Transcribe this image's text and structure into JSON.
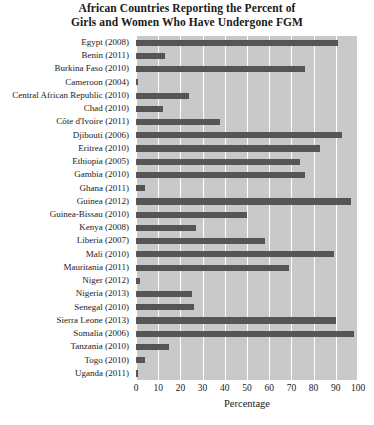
{
  "chart_data": {
    "type": "bar",
    "orientation": "horizontal",
    "title": "African Countries Reporting the Percent of Girls and Women Who Have Undergone FGM",
    "title_lines": [
      "African Countries Reporting the Percent of",
      "Girls and Women Who Have Undergone FGM"
    ],
    "xlabel": "Percentage",
    "ylabel": "",
    "xlim": [
      0,
      100
    ],
    "xticks": [
      0,
      10,
      20,
      30,
      40,
      50,
      60,
      70,
      80,
      90,
      100
    ],
    "xtick_labels": [
      "0",
      "10",
      "20",
      "30",
      "40",
      "50",
      "60",
      "70",
      "80",
      "90",
      "100"
    ],
    "grid": "vertical-white",
    "legend": "none",
    "plot_background": "#c9c9c9",
    "bar_color": "#555555",
    "categories": [
      "Egypt (2008)",
      "Benin (2011)",
      "Burkina Faso (2010)",
      "Cameroon (2004)",
      "Central African Republic (2010)",
      "Chad (2010)",
      "Côte d'Ivoire (2011)",
      "Djibouti (2006)",
      "Eritrea (2010)",
      "Ethiopia (2005)",
      "Gambia (2010)",
      "Ghana (2011)",
      "Guinea (2012)",
      "Guinea-Bissau (2010)",
      "Kenya (2008)",
      "Liberia (2007)",
      "Mali (2010)",
      "Mauritania (2011)",
      "Niger (2012)",
      "Nigeria (2013)",
      "Senegal (2010)",
      "Sierra Leone (2013)",
      "Somalia (2006)",
      "Tanzania (2010)",
      "Togo (2010)",
      "Uganda (2011)"
    ],
    "values": [
      91,
      13,
      76,
      1,
      24,
      12,
      38,
      93,
      83,
      74,
      76,
      4,
      97,
      50,
      27,
      58,
      89,
      69,
      2,
      25,
      26,
      90,
      98,
      15,
      4,
      1
    ]
  }
}
